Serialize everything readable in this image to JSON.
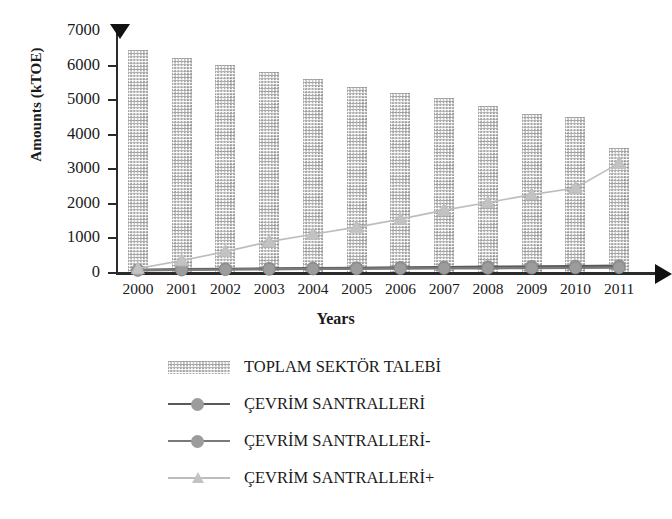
{
  "chart_data": {
    "type": "bar",
    "title": "",
    "xlabel": "Years",
    "ylabel": "Amounts  (kTOE)",
    "categories": [
      "2000",
      "2001",
      "2002",
      "2003",
      "2004",
      "2005",
      "2006",
      "2007",
      "2008",
      "2009",
      "2010",
      "2011"
    ],
    "ylim": [
      0,
      7000
    ],
    "yticks": [
      0,
      1000,
      2000,
      3000,
      4000,
      5000,
      6000,
      7000
    ],
    "ytick_labels": [
      "0",
      "1000",
      "2000",
      "3000",
      "4000",
      "5000",
      "6000",
      "7000"
    ],
    "grid": false,
    "legend_position": "below",
    "series": [
      {
        "name": "TOPLAM SEKTÖR TALEBİ",
        "type": "bar",
        "marker": "none",
        "color": "#9a9a9a",
        "values": [
          6420,
          6200,
          6000,
          5800,
          5580,
          5350,
          5180,
          5030,
          4800,
          4580,
          4480,
          3600
        ]
      },
      {
        "name": "ÇEVRİM SANTRALLERİ",
        "type": "line",
        "marker": "circle",
        "color": "#595959",
        "values": [
          60,
          80,
          90,
          100,
          110,
          120,
          130,
          140,
          150,
          160,
          170,
          180
        ]
      },
      {
        "name": "ÇEVRİM SANTRALLERİ-",
        "type": "line",
        "marker": "circle",
        "color": "#7a7a7a",
        "values": [
          50,
          60,
          70,
          80,
          90,
          95,
          100,
          105,
          110,
          115,
          120,
          130
        ]
      },
      {
        "name": "ÇEVRİM SANTRALLERİ+",
        "type": "line",
        "marker": "triangle",
        "color": "#bdbdbd",
        "values": [
          100,
          330,
          590,
          880,
          1090,
          1300,
          1530,
          1790,
          2010,
          2240,
          2430,
          3150
        ]
      }
    ]
  },
  "axis": {
    "y_arrow": "triangle-down-marker",
    "x_arrow": "triangle-right-marker"
  },
  "legend": {
    "items": [
      {
        "label": "TOPLAM SEKTÖR TALEBİ",
        "key": "pattern-swatch"
      },
      {
        "label": "ÇEVRİM SANTRALLERİ",
        "key": "line-circle-marker"
      },
      {
        "label": "ÇEVRİM SANTRALLERİ-",
        "key": "line-circle-marker"
      },
      {
        "label": "ÇEVRİM SANTRALLERİ+",
        "key": "line-triangle-marker"
      }
    ]
  }
}
